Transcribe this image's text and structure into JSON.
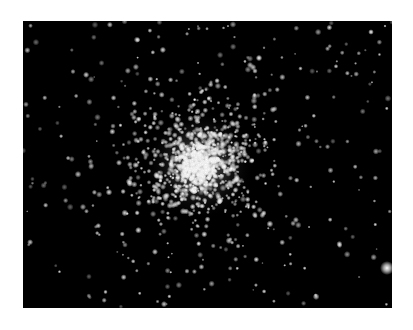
{
  "image": {
    "subject": "globular star cluster",
    "background_color": "#000000",
    "page_background": "#ffffff",
    "frame": {
      "x": 23,
      "y": 21,
      "width": 369,
      "height": 287
    },
    "cluster_center": {
      "x": 177,
      "y": 144
    },
    "bright_stars": [
      {
        "x": 364,
        "y": 247,
        "r": 3.5
      },
      {
        "x": 236,
        "y": 37,
        "r": 1.6
      },
      {
        "x": 348,
        "y": 11,
        "r": 1.4
      }
    ]
  }
}
